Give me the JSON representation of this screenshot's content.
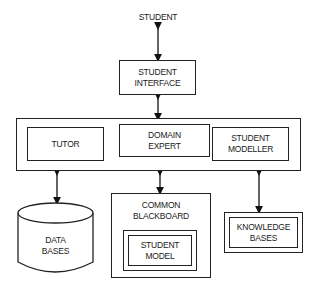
{
  "diagram": {
    "nodes": {
      "student": {
        "label": "STUDENT"
      },
      "student_interface": {
        "lines": [
          "STUDENT",
          "INTERFACE"
        ]
      },
      "tutor": {
        "lines": [
          "TUTOR"
        ]
      },
      "domain_expert": {
        "lines": [
          "DOMAIN",
          "EXPERT"
        ]
      },
      "student_modeller": {
        "lines": [
          "STUDENT",
          "MODELLER"
        ]
      },
      "data_bases": {
        "lines": [
          "DATA",
          "BASES"
        ]
      },
      "common_blackboard": {
        "lines": [
          "COMMON",
          "BLACKBOARD"
        ]
      },
      "student_model": {
        "lines": [
          "STUDENT",
          "MODEL"
        ]
      },
      "knowledge_bases": {
        "lines": [
          "KNOWLEDGE",
          "BASES"
        ]
      }
    },
    "edges": [
      {
        "from": "student",
        "to": "student_interface",
        "type": "bidirectional"
      },
      {
        "from": "student_interface",
        "to": "core_group",
        "type": "bidirectional"
      },
      {
        "from": "core_group",
        "to": "data_bases",
        "type": "bidirectional"
      },
      {
        "from": "core_group",
        "to": "common_blackboard",
        "type": "bidirectional"
      },
      {
        "from": "core_group",
        "to": "knowledge_bases",
        "type": "bidirectional"
      }
    ]
  }
}
